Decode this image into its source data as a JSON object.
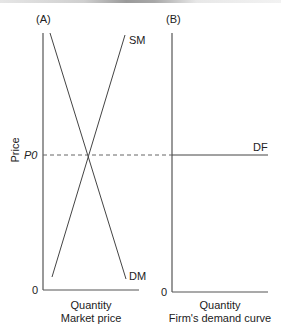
{
  "panels": {
    "a": {
      "tag": "(A)",
      "supply_label": "SM",
      "demand_label": "DM",
      "price_level_label": "P0",
      "origin_label": "0",
      "xlabel": "Quantity",
      "caption": "Market price"
    },
    "b": {
      "tag": "(B)",
      "demand_label": "DF",
      "origin_label": "0",
      "xlabel": "Quantity",
      "caption": "Firm's demand curve"
    }
  },
  "ylabel": "Price",
  "colors": {
    "line": "#444444",
    "axis": "#555555",
    "dashed": "#666666"
  }
}
